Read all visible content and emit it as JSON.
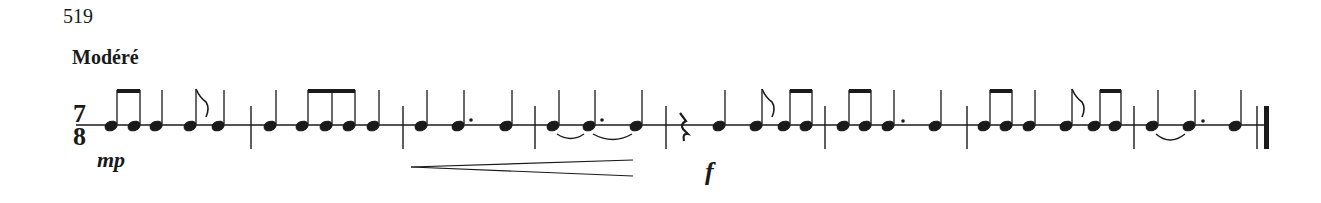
{
  "exercise": {
    "number": "519",
    "tempo": "Modéré"
  },
  "time_signature": {
    "numerator": "7",
    "denominator": "8"
  },
  "dynamics": [
    {
      "label": "mp",
      "x": 95,
      "measure": 1
    },
    {
      "label": "f",
      "x": 705,
      "measure": 5
    }
  ],
  "hairpin": {
    "type": "crescendo",
    "from_x": 411,
    "to_x": 633,
    "measures": [
      3,
      4
    ]
  },
  "staff": {
    "type": "single-line percussion",
    "y": 125,
    "x_start": 76,
    "x_end": 1265
  },
  "measures": [
    {
      "index": 1,
      "rhythm": [
        "eighth-beamed",
        "eighth-beamed",
        "quarter",
        "eighth",
        "quarter"
      ]
    },
    {
      "index": 2,
      "rhythm": [
        "quarter",
        "eighth-beamed",
        "eighth-beamed",
        "eighth-beamed",
        "quarter"
      ]
    },
    {
      "index": 3,
      "rhythm": [
        "quarter",
        "dotted-quarter",
        "quarter"
      ]
    },
    {
      "index": 4,
      "rhythm": [
        "quarter-tied",
        "dotted-quarter-tied",
        "quarter"
      ]
    },
    {
      "index": 5,
      "rhythm": [
        "eighth-rest",
        "quarter",
        "eighth",
        "eighth-beamed",
        "eighth-beamed"
      ]
    },
    {
      "index": 6,
      "rhythm": [
        "eighth-beamed",
        "eighth-beamed",
        "dotted-quarter",
        "quarter"
      ]
    },
    {
      "index": 7,
      "rhythm": [
        "eighth-beamed",
        "eighth-beamed",
        "quarter",
        "eighth",
        "eighth-beamed",
        "eighth-beamed"
      ]
    },
    {
      "index": 8,
      "rhythm": [
        "quarter-tied",
        "dotted-quarter",
        "quarter"
      ]
    }
  ],
  "final_barline": "final double bar"
}
